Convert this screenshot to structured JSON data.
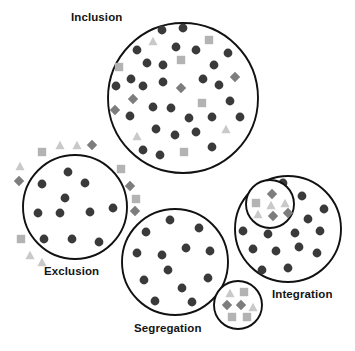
{
  "diagram": {
    "type": "concept-diagram",
    "background": "#ffffff",
    "colors": {
      "outline": "#111111",
      "majority_circle": "#3a3a3a",
      "square": "#b3b3b3",
      "triangle": "#c9c9c9",
      "diamond": "#7d7d7d",
      "label_text": "#141414"
    },
    "legend_semantics": {
      "dark-circle": "majority / dominant group member",
      "light-square": "minority group member type A",
      "light-triangle": "minority group member type B",
      "gray-diamond": "minority group member type C"
    },
    "labels": [
      {
        "id": "inclusion",
        "text": "Inclusion",
        "x": 71,
        "y": 11
      },
      {
        "id": "exclusion",
        "text": "Exclusion",
        "x": 44,
        "y": 265
      },
      {
        "id": "segregation",
        "text": "Segregation",
        "x": 134,
        "y": 322
      },
      {
        "id": "integration",
        "text": "Integration",
        "x": 272,
        "y": 288
      }
    ],
    "groups": [
      {
        "id": "inclusion",
        "label": "Inclusion",
        "circle": {
          "cx": 183,
          "cy": 98,
          "r": 75
        },
        "inner_circle": null,
        "markers": [
          {
            "shape": "circle",
            "x": 162,
            "y": 30
          },
          {
            "shape": "circle",
            "x": 183,
            "y": 28
          },
          {
            "shape": "triangle",
            "x": 153,
            "y": 41
          },
          {
            "shape": "square",
            "x": 209,
            "y": 40
          },
          {
            "shape": "circle",
            "x": 137,
            "y": 50
          },
          {
            "shape": "circle",
            "x": 176,
            "y": 47
          },
          {
            "shape": "circle",
            "x": 196,
            "y": 50
          },
          {
            "shape": "circle",
            "x": 228,
            "y": 53
          },
          {
            "shape": "square",
            "x": 119,
            "y": 67
          },
          {
            "shape": "circle",
            "x": 147,
            "y": 63
          },
          {
            "shape": "circle",
            "x": 163,
            "y": 65
          },
          {
            "shape": "square",
            "x": 181,
            "y": 60
          },
          {
            "shape": "circle",
            "x": 214,
            "y": 65
          },
          {
            "shape": "circle",
            "x": 131,
            "y": 79
          },
          {
            "shape": "circle",
            "x": 116,
            "y": 86
          },
          {
            "shape": "circle",
            "x": 143,
            "y": 86
          },
          {
            "shape": "circle",
            "x": 163,
            "y": 82
          },
          {
            "shape": "diamond",
            "x": 181,
            "y": 88
          },
          {
            "shape": "circle",
            "x": 203,
            "y": 79
          },
          {
            "shape": "circle",
            "x": 219,
            "y": 85
          },
          {
            "shape": "diamond",
            "x": 235,
            "y": 77
          },
          {
            "shape": "diamond",
            "x": 133,
            "y": 99
          },
          {
            "shape": "circle",
            "x": 153,
            "y": 107
          },
          {
            "shape": "circle",
            "x": 171,
            "y": 108
          },
          {
            "shape": "circle",
            "x": 230,
            "y": 101
          },
          {
            "shape": "square",
            "x": 202,
            "y": 103
          },
          {
            "shape": "diamond",
            "x": 115,
            "y": 110
          },
          {
            "shape": "circle",
            "x": 130,
            "y": 116
          },
          {
            "shape": "circle",
            "x": 189,
            "y": 118
          },
          {
            "shape": "circle",
            "x": 212,
            "y": 117
          },
          {
            "shape": "circle",
            "x": 240,
            "y": 117
          },
          {
            "shape": "triangle",
            "x": 137,
            "y": 136
          },
          {
            "shape": "circle",
            "x": 156,
            "y": 129
          },
          {
            "shape": "circle",
            "x": 175,
            "y": 135
          },
          {
            "shape": "circle",
            "x": 196,
            "y": 132
          },
          {
            "shape": "triangle",
            "x": 226,
            "y": 129
          },
          {
            "shape": "circle",
            "x": 143,
            "y": 150
          },
          {
            "shape": "circle",
            "x": 160,
            "y": 155
          },
          {
            "shape": "square",
            "x": 184,
            "y": 152
          },
          {
            "shape": "circle",
            "x": 212,
            "y": 147
          }
        ]
      },
      {
        "id": "exclusion",
        "label": "Exclusion",
        "circle": {
          "cx": 75,
          "cy": 207,
          "r": 52
        },
        "inner_circle": null,
        "markers": [
          {
            "shape": "circle",
            "x": 68,
            "y": 172
          },
          {
            "shape": "circle",
            "x": 42,
            "y": 184
          },
          {
            "shape": "circle",
            "x": 85,
            "y": 183
          },
          {
            "shape": "circle",
            "x": 65,
            "y": 198
          },
          {
            "shape": "circle",
            "x": 38,
            "y": 213
          },
          {
            "shape": "circle",
            "x": 60,
            "y": 213
          },
          {
            "shape": "circle",
            "x": 90,
            "y": 212
          },
          {
            "shape": "circle",
            "x": 113,
            "y": 208
          },
          {
            "shape": "circle",
            "x": 44,
            "y": 239
          },
          {
            "shape": "circle",
            "x": 72,
            "y": 239
          },
          {
            "shape": "circle",
            "x": 99,
            "y": 242
          }
        ],
        "outside_markers": [
          {
            "shape": "triangle",
            "x": 60,
            "y": 145
          },
          {
            "shape": "triangle",
            "x": 77,
            "y": 145
          },
          {
            "shape": "diamond",
            "x": 92,
            "y": 145
          },
          {
            "shape": "square",
            "x": 42,
            "y": 152
          },
          {
            "shape": "triangle",
            "x": 20,
            "y": 166
          },
          {
            "shape": "square",
            "x": 121,
            "y": 169
          },
          {
            "shape": "diamond",
            "x": 19,
            "y": 181
          },
          {
            "shape": "diamond",
            "x": 130,
            "y": 186
          },
          {
            "shape": "square",
            "x": 136,
            "y": 199
          },
          {
            "shape": "diamond",
            "x": 135,
            "y": 211
          },
          {
            "shape": "square",
            "x": 21,
            "y": 239
          },
          {
            "shape": "triangle",
            "x": 30,
            "y": 255
          },
          {
            "shape": "triangle",
            "x": 42,
            "y": 262
          }
        ]
      },
      {
        "id": "segregation",
        "label": "Segregation",
        "circle": {
          "cx": 175,
          "cy": 262,
          "r": 53
        },
        "satellite_circle": {
          "cx": 238,
          "cy": 305,
          "r": 24
        },
        "markers": [
          {
            "shape": "circle",
            "x": 170,
            "y": 220
          },
          {
            "shape": "circle",
            "x": 146,
            "y": 232
          },
          {
            "shape": "circle",
            "x": 199,
            "y": 228
          },
          {
            "shape": "circle",
            "x": 137,
            "y": 253
          },
          {
            "shape": "circle",
            "x": 162,
            "y": 255
          },
          {
            "shape": "circle",
            "x": 186,
            "y": 248
          },
          {
            "shape": "circle",
            "x": 210,
            "y": 251
          },
          {
            "shape": "circle",
            "x": 144,
            "y": 280
          },
          {
            "shape": "circle",
            "x": 168,
            "y": 270
          },
          {
            "shape": "circle",
            "x": 182,
            "y": 288
          },
          {
            "shape": "circle",
            "x": 208,
            "y": 278
          },
          {
            "shape": "circle",
            "x": 155,
            "y": 301
          },
          {
            "shape": "circle",
            "x": 192,
            "y": 302
          }
        ],
        "satellite_markers": [
          {
            "shape": "triangle",
            "x": 230,
            "y": 293
          },
          {
            "shape": "square",
            "x": 244,
            "y": 292
          },
          {
            "shape": "diamond",
            "x": 227,
            "y": 305
          },
          {
            "shape": "diamond",
            "x": 241,
            "y": 305
          },
          {
            "shape": "triangle",
            "x": 253,
            "y": 307
          },
          {
            "shape": "square",
            "x": 232,
            "y": 317
          },
          {
            "shape": "square",
            "x": 247,
            "y": 317
          }
        ]
      },
      {
        "id": "integration",
        "label": "Integration",
        "circle": {
          "cx": 288,
          "cy": 229,
          "r": 53
        },
        "inner_circle": {
          "cx": 270,
          "cy": 204,
          "r": 24
        },
        "markers": [
          {
            "shape": "circle",
            "x": 283,
            "y": 183
          },
          {
            "shape": "circle",
            "x": 302,
            "y": 196
          },
          {
            "shape": "circle",
            "x": 324,
            "y": 209
          },
          {
            "shape": "circle",
            "x": 308,
            "y": 219
          },
          {
            "shape": "circle",
            "x": 243,
            "y": 231
          },
          {
            "shape": "circle",
            "x": 268,
            "y": 234
          },
          {
            "shape": "circle",
            "x": 295,
            "y": 233
          },
          {
            "shape": "circle",
            "x": 320,
            "y": 231
          },
          {
            "shape": "circle",
            "x": 253,
            "y": 249
          },
          {
            "shape": "circle",
            "x": 276,
            "y": 251
          },
          {
            "shape": "circle",
            "x": 299,
            "y": 247
          },
          {
            "shape": "circle",
            "x": 317,
            "y": 253
          },
          {
            "shape": "circle",
            "x": 262,
            "y": 270
          },
          {
            "shape": "circle",
            "x": 288,
            "y": 268
          }
        ],
        "inner_markers": [
          {
            "shape": "diamond",
            "x": 272,
            "y": 194
          },
          {
            "shape": "square",
            "x": 256,
            "y": 203
          },
          {
            "shape": "triangle",
            "x": 271,
            "y": 205
          },
          {
            "shape": "triangle",
            "x": 285,
            "y": 203
          },
          {
            "shape": "triangle",
            "x": 258,
            "y": 214
          },
          {
            "shape": "diamond",
            "x": 273,
            "y": 216
          },
          {
            "shape": "diamond",
            "x": 288,
            "y": 213
          }
        ]
      }
    ]
  }
}
